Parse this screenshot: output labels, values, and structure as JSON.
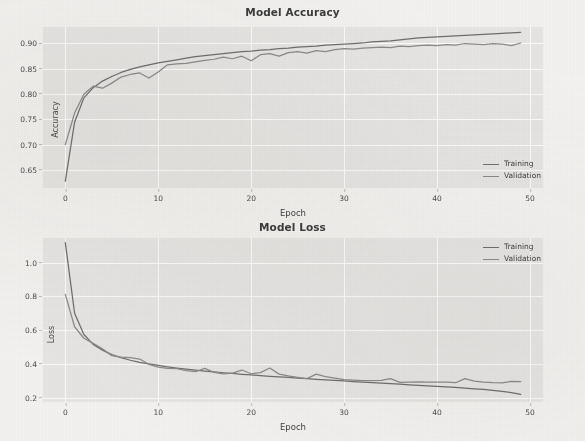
{
  "figure": {
    "background_color": "#f3f2f0",
    "axes_facecolor": "#e6e5e3",
    "grid_color": "#fbfbfa",
    "training_color": "#6e6e6e",
    "validation_color": "#8a8a8a"
  },
  "chart_data": [
    {
      "type": "line",
      "title": "Model Accuracy",
      "xlabel": "Epoch",
      "ylabel": "Accuracy",
      "xlim": [
        -2.4,
        51.4
      ],
      "ylim": [
        0.6215,
        0.9385
      ],
      "xticks": [
        0,
        10,
        20,
        30,
        40,
        50
      ],
      "yticks": [
        0.65,
        0.7,
        0.75,
        0.8,
        0.85,
        0.9
      ],
      "xticklabels": [
        "0",
        "10",
        "20",
        "30",
        "40",
        "50"
      ],
      "yticklabels": [
        "0.65",
        "0.70",
        "0.75",
        "0.80",
        "0.85",
        "0.90"
      ],
      "grid": true,
      "legend_position": "lower right",
      "x": [
        0,
        1,
        2,
        3,
        4,
        5,
        6,
        7,
        8,
        9,
        10,
        11,
        12,
        13,
        14,
        15,
        16,
        17,
        18,
        19,
        20,
        21,
        22,
        23,
        24,
        25,
        26,
        27,
        28,
        29,
        30,
        31,
        32,
        33,
        34,
        35,
        36,
        37,
        38,
        39,
        40,
        41,
        42,
        43,
        44,
        45,
        46,
        47,
        48,
        49
      ],
      "series": [
        {
          "name": "Training",
          "color": "#6e6e6e",
          "values": [
            0.635,
            0.751,
            0.799,
            0.819,
            0.832,
            0.841,
            0.849,
            0.855,
            0.86,
            0.864,
            0.868,
            0.871,
            0.874,
            0.877,
            0.88,
            0.882,
            0.884,
            0.886,
            0.888,
            0.89,
            0.891,
            0.893,
            0.894,
            0.896,
            0.897,
            0.899,
            0.9,
            0.901,
            0.903,
            0.904,
            0.905,
            0.906,
            0.907,
            0.909,
            0.91,
            0.911,
            0.913,
            0.915,
            0.917,
            0.918,
            0.919,
            0.92,
            0.921,
            0.922,
            0.923,
            0.924,
            0.925,
            0.926,
            0.927,
            0.928
          ]
        },
        {
          "name": "Validation",
          "color": "#8a8a8a",
          "values": [
            0.707,
            0.769,
            0.806,
            0.822,
            0.818,
            0.828,
            0.84,
            0.845,
            0.848,
            0.838,
            0.85,
            0.864,
            0.866,
            0.867,
            0.87,
            0.873,
            0.875,
            0.879,
            0.876,
            0.881,
            0.872,
            0.884,
            0.886,
            0.881,
            0.888,
            0.89,
            0.887,
            0.892,
            0.89,
            0.894,
            0.896,
            0.895,
            0.897,
            0.898,
            0.899,
            0.898,
            0.901,
            0.9,
            0.902,
            0.903,
            0.902,
            0.904,
            0.903,
            0.906,
            0.905,
            0.904,
            0.906,
            0.905,
            0.902,
            0.907
          ]
        }
      ]
    },
    {
      "type": "line",
      "title": "Model Loss",
      "xlabel": "Epoch",
      "ylabel": "Loss",
      "xlim": [
        -2.4,
        51.4
      ],
      "ylim": [
        0.175,
        1.145
      ],
      "xticks": [
        0,
        10,
        20,
        30,
        40,
        50
      ],
      "yticks": [
        0.2,
        0.4,
        0.6,
        0.8,
        1.0
      ],
      "xticklabels": [
        "0",
        "10",
        "20",
        "30",
        "40",
        "50"
      ],
      "yticklabels": [
        "0.2",
        "0.4",
        "0.6",
        "0.8",
        "1.0"
      ],
      "grid": true,
      "legend_position": "upper right",
      "x": [
        0,
        1,
        2,
        3,
        4,
        5,
        6,
        7,
        8,
        9,
        10,
        11,
        12,
        13,
        14,
        15,
        16,
        17,
        18,
        19,
        20,
        21,
        22,
        23,
        24,
        25,
        26,
        27,
        28,
        29,
        30,
        31,
        32,
        33,
        34,
        35,
        36,
        37,
        38,
        39,
        40,
        41,
        42,
        43,
        44,
        45,
        46,
        47,
        48,
        49
      ],
      "series": [
        {
          "name": "Training",
          "color": "#6e6e6e",
          "values": [
            1.118,
            0.7,
            0.574,
            0.516,
            0.482,
            0.455,
            0.437,
            0.422,
            0.41,
            0.4,
            0.391,
            0.383,
            0.376,
            0.37,
            0.364,
            0.358,
            0.353,
            0.348,
            0.344,
            0.339,
            0.335,
            0.331,
            0.327,
            0.323,
            0.32,
            0.316,
            0.313,
            0.309,
            0.306,
            0.303,
            0.3,
            0.296,
            0.293,
            0.29,
            0.287,
            0.284,
            0.281,
            0.277,
            0.274,
            0.271,
            0.268,
            0.264,
            0.261,
            0.257,
            0.253,
            0.249,
            0.244,
            0.238,
            0.231,
            0.22
          ]
        },
        {
          "name": "Validation",
          "color": "#8a8a8a",
          "values": [
            0.812,
            0.62,
            0.552,
            0.522,
            0.49,
            0.449,
            0.44,
            0.437,
            0.429,
            0.398,
            0.381,
            0.374,
            0.372,
            0.36,
            0.354,
            0.374,
            0.35,
            0.342,
            0.346,
            0.364,
            0.342,
            0.349,
            0.376,
            0.34,
            0.329,
            0.321,
            0.313,
            0.34,
            0.325,
            0.316,
            0.307,
            0.304,
            0.302,
            0.301,
            0.303,
            0.313,
            0.291,
            0.292,
            0.294,
            0.293,
            0.293,
            0.292,
            0.289,
            0.313,
            0.299,
            0.293,
            0.289,
            0.288,
            0.297,
            0.295
          ]
        }
      ]
    }
  ]
}
